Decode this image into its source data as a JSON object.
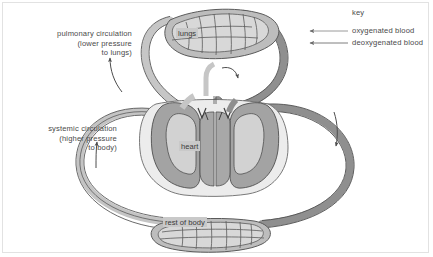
{
  "diagram": {
    "key": {
      "title": "key",
      "entries": [
        {
          "label": "oxygenated blood",
          "color": "#b9b9b9",
          "marker": "left-arrow-icon"
        },
        {
          "label": "deoxygenated blood",
          "color": "#8c8c8c",
          "marker": "left-arrow-icon"
        }
      ]
    },
    "annotations": [
      {
        "name": "pulmonary-circulation-label",
        "lines": [
          "pulmonary circulation",
          "(lower pressure",
          "to lungs)"
        ],
        "text": "pulmonary circulation\n(lower pressure\nto lungs)"
      },
      {
        "name": "systemic-circulation-label",
        "lines": [
          "systemic circulation",
          "(higher pressure",
          "to body)"
        ],
        "text": "systemic circulation\n(higher pressure\nto body)"
      }
    ],
    "organs": [
      {
        "name": "lungs",
        "label": "lungs"
      },
      {
        "name": "heart",
        "label": "heart"
      },
      {
        "name": "rest-of-body",
        "label": "rest of body"
      }
    ],
    "flow_arrows": [
      {
        "name": "pulmonary-outflow-arrow",
        "direction": "up",
        "side": "left"
      },
      {
        "name": "pulmonary-inflow-arrow",
        "direction": "down",
        "side": "center-right"
      },
      {
        "name": "systemic-return-arrow",
        "direction": "up",
        "side": "far-left"
      },
      {
        "name": "systemic-outflow-arrow",
        "direction": "down",
        "side": "far-right"
      }
    ],
    "colors": {
      "oxygenated": "#c6c6c6",
      "deoxygenated": "#8f8f8f",
      "outline": "#555555",
      "heart_fill": "#a8a8a8",
      "heart_pale": "#e4e4e4",
      "text": "#4a4a4a",
      "label_bg": "#c9c9c9",
      "background": "#ffffff",
      "border": "#e2e2e2"
    }
  }
}
